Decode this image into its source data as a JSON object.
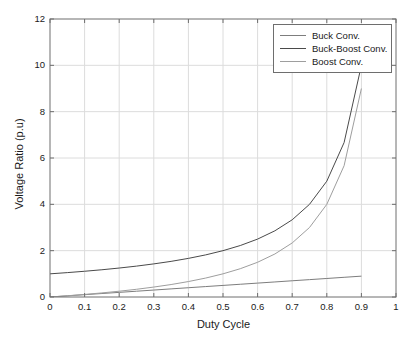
{
  "chart_data": {
    "type": "line",
    "title": "",
    "xlabel": "Duty Cycle",
    "ylabel": "Voltage Ratio (p.u)",
    "xlim": [
      0,
      1
    ],
    "ylim": [
      0,
      12
    ],
    "xticks": [
      "0",
      "0.1",
      "0.2",
      "0.3",
      "0.4",
      "0.5",
      "0.6",
      "0.7",
      "0.8",
      "0.9",
      "1"
    ],
    "xtick_values": [
      0,
      0.1,
      0.2,
      0.3,
      0.4,
      0.5,
      0.6,
      0.7,
      0.8,
      0.9,
      1
    ],
    "yticks": [
      "0",
      "2",
      "4",
      "6",
      "8",
      "10",
      "12"
    ],
    "ytick_values": [
      0,
      2,
      4,
      6,
      8,
      10,
      12
    ],
    "grid": true,
    "legend_position": "top-right",
    "x": [
      0,
      0.05,
      0.1,
      0.15,
      0.2,
      0.25,
      0.3,
      0.35,
      0.4,
      0.45,
      0.5,
      0.55,
      0.6,
      0.65,
      0.7,
      0.75,
      0.8,
      0.85,
      0.9
    ],
    "series": [
      {
        "name": "Buck Conv.",
        "color": "#7d7d7d",
        "values": [
          0,
          0.05,
          0.1,
          0.15,
          0.2,
          0.25,
          0.3,
          0.35,
          0.4,
          0.45,
          0.5,
          0.55,
          0.6,
          0.65,
          0.7,
          0.75,
          0.8,
          0.85,
          0.9
        ]
      },
      {
        "name": "Buck-Boost Conv.",
        "color": "#4a4a4a",
        "values": [
          1,
          1.053,
          1.111,
          1.176,
          1.25,
          1.333,
          1.429,
          1.538,
          1.667,
          1.818,
          2,
          2.222,
          2.5,
          2.857,
          3.333,
          4,
          5,
          6.667,
          10
        ]
      },
      {
        "name": "Boost Conv.",
        "color": "#9e9e9e",
        "values": [
          0,
          0.053,
          0.111,
          0.176,
          0.25,
          0.333,
          0.429,
          0.538,
          0.667,
          0.818,
          1,
          1.222,
          1.5,
          1.857,
          2.333,
          3,
          4,
          5.667,
          9
        ]
      }
    ]
  },
  "legend": {
    "items": [
      {
        "label": "Buck Conv."
      },
      {
        "label": "Buck-Boost Conv."
      },
      {
        "label": "Boost Conv."
      }
    ]
  },
  "colors": {
    "axis": "#6e6e6e",
    "grid": "#dcdcdc",
    "text": "#1a1a1a",
    "background": "#ffffff"
  }
}
